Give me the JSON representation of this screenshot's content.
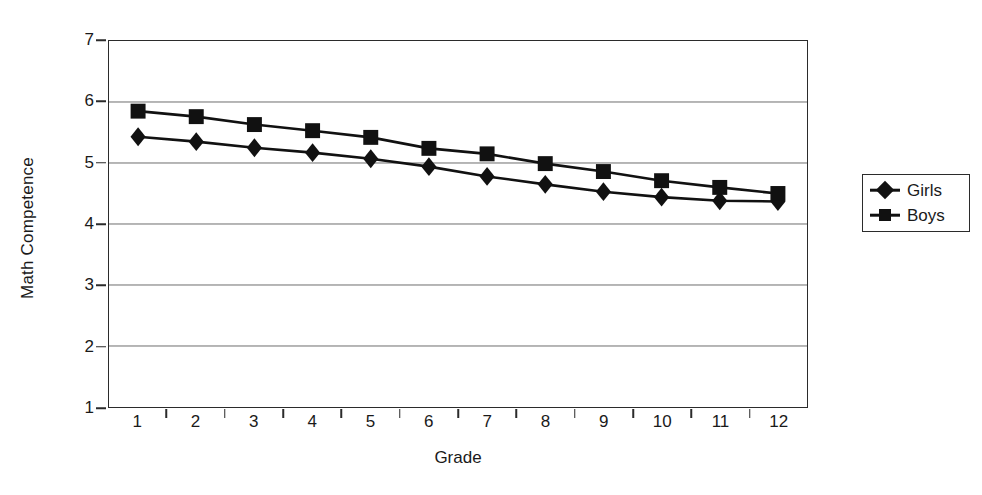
{
  "chart_data": {
    "type": "line",
    "title": "",
    "xlabel": "Grade",
    "ylabel": "Math Competence",
    "categories": [
      "1",
      "2",
      "3",
      "4",
      "5",
      "6",
      "7",
      "8",
      "9",
      "10",
      "11",
      "12"
    ],
    "x": [
      1,
      2,
      3,
      4,
      5,
      6,
      7,
      8,
      9,
      10,
      11,
      12
    ],
    "xlim": [
      0.5,
      12.5
    ],
    "ylim": [
      1,
      7
    ],
    "yticks": [
      "1",
      "2",
      "3",
      "4",
      "5",
      "6",
      "7"
    ],
    "grid": "horizontal",
    "legend_position": "right",
    "series": [
      {
        "name": "Girls",
        "marker": "diamond",
        "values": [
          5.43,
          5.35,
          5.25,
          5.17,
          5.07,
          4.94,
          4.78,
          4.65,
          4.53,
          4.44,
          4.38,
          4.37
        ]
      },
      {
        "name": "Boys",
        "marker": "square",
        "values": [
          5.85,
          5.76,
          5.63,
          5.53,
          5.42,
          5.24,
          5.15,
          4.99,
          4.86,
          4.71,
          4.6,
          4.5
        ]
      }
    ],
    "colors": {
      "line": "#111111",
      "axis": "#2b2b2b",
      "grid": "#6e6e6e",
      "background": "#ffffff"
    }
  },
  "legend": {
    "items": [
      {
        "label": "Girls",
        "marker": "diamond"
      },
      {
        "label": "Boys",
        "marker": "square"
      }
    ]
  }
}
